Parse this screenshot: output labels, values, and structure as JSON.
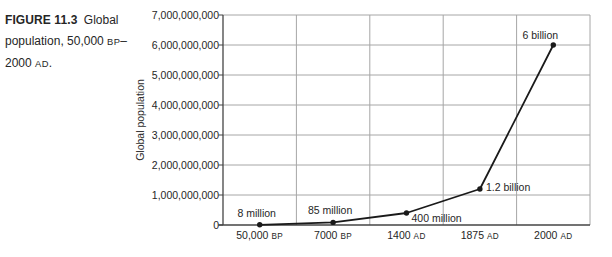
{
  "figure": {
    "caption_lines": [
      [
        {
          "t": "FIGURE 11.3",
          "s": "bold"
        },
        {
          "t": " Global",
          "s": ""
        }
      ],
      [
        {
          "t": "population, 50,000 ",
          "s": ""
        },
        {
          "t": "BP",
          "s": "era"
        },
        {
          "t": "–",
          "s": ""
        }
      ],
      [
        {
          "t": "2000 ",
          "s": ""
        },
        {
          "t": "AD",
          "s": "era"
        },
        {
          "t": ".",
          "s": ""
        }
      ]
    ]
  },
  "chart_data": {
    "type": "line",
    "title": "",
    "xlabel": "",
    "ylabel": "Global population",
    "ylim": [
      0,
      7000000000
    ],
    "grid": true,
    "legend": "none",
    "categories": [
      "50,000 BP",
      "7000 BP",
      "1400 AD",
      "1875 AD",
      "2000 AD"
    ],
    "x_tick_labels": [
      {
        "text": "50,000",
        "era": "BP"
      },
      {
        "text": "7000",
        "era": "BP"
      },
      {
        "text": "1400",
        "era": "AD"
      },
      {
        "text": "1875",
        "era": "AD"
      },
      {
        "text": "2000",
        "era": "AD"
      }
    ],
    "values": [
      8000000,
      85000000,
      400000000,
      1200000000,
      6000000000
    ],
    "point_labels": [
      {
        "text": "8 million",
        "anchor": "above"
      },
      {
        "text": "85 million",
        "anchor": "above"
      },
      {
        "text": "400 million",
        "anchor": "right-below"
      },
      {
        "text": "1.2 billion",
        "anchor": "right"
      },
      {
        "text": "6 billion",
        "anchor": "above-left"
      }
    ],
    "y_ticks": [
      {
        "value": 0,
        "label": "0"
      },
      {
        "value": 1000000000,
        "label": "1,000,000,000"
      },
      {
        "value": 2000000000,
        "label": "2,000,000,000"
      },
      {
        "value": 3000000000,
        "label": "3,000,000,000"
      },
      {
        "value": 4000000000,
        "label": "4,000,000,000"
      },
      {
        "value": 5000000000,
        "label": "5,000,000,000"
      },
      {
        "value": 6000000000,
        "label": "6,000,000,000"
      },
      {
        "value": 7000000000,
        "label": "7,000,000,000"
      }
    ],
    "colors": {
      "line": "#1a1a1a",
      "marker": "#1a1a1a",
      "grid": "#a6a6a6",
      "axis": "#444444",
      "text": "#262626",
      "background": "#ffffff"
    }
  }
}
